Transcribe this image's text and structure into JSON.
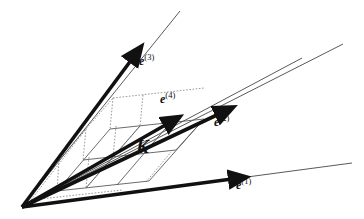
{
  "figure": {
    "background_color": "#ffffff",
    "stroke_color": "#111111",
    "thin_stroke_color": "#5a5a5a",
    "dotted_stroke_color": "#8d8d8d",
    "origin": {
      "x": 22,
      "y": 207
    }
  },
  "vectors": [
    {
      "name": "e1",
      "label_base": "e",
      "label_sup": "(1)",
      "label_text": "e(1)",
      "tip": {
        "x": 238,
        "y": 175
      },
      "ray_end": {
        "x": 352,
        "y": 163
      },
      "label_pos": {
        "x": 236,
        "y": 180
      }
    },
    {
      "name": "e2",
      "label_base": "e",
      "label_sup": "(2)",
      "label_text": "e(2)",
      "tip": {
        "x": 225,
        "y": 110
      },
      "ray_end": {
        "x": 313,
        "y": 57
      },
      "label_pos": {
        "x": 215,
        "y": 117
      }
    },
    {
      "name": "e3",
      "label_base": "e",
      "label_sup": "(3)",
      "label_text": "e(3)",
      "tip": {
        "x": 137,
        "y": 53
      },
      "ray_end": {
        "x": 180,
        "y": 11
      },
      "label_pos": {
        "x": 139,
        "y": 57
      }
    },
    {
      "name": "e4",
      "label_base": "e",
      "label_sup": "(4)",
      "label_text": "e(4)",
      "tip": {
        "x": 172,
        "y": 120
      },
      "ray_end": {
        "x": 261,
        "y": 83
      },
      "label_pos": {
        "x": 162,
        "y": 94
      }
    }
  ],
  "cell": {
    "name": "K",
    "label": "K",
    "label_pos": {
      "x": 139,
      "y": 146
    }
  },
  "lattice": {
    "solid_lines": [
      {
        "name": "grid-a1",
        "x1": 57,
        "y1": 191,
        "x2": 146,
        "y2": 182
      },
      {
        "name": "grid-a2",
        "x1": 83,
        "y1": 160,
        "x2": 174,
        "y2": 151
      },
      {
        "name": "grid-a3",
        "x1": 110,
        "y1": 129,
        "x2": 201,
        "y2": 119
      },
      {
        "name": "grid-b1",
        "x1": 57,
        "y1": 191,
        "x2": 110,
        "y2": 129
      },
      {
        "name": "grid-b2",
        "x1": 86,
        "y1": 188,
        "x2": 140,
        "y2": 125
      },
      {
        "name": "grid-b3",
        "x1": 116,
        "y1": 185,
        "x2": 170,
        "y2": 122
      },
      {
        "name": "grid-b4",
        "x1": 146,
        "y1": 182,
        "x2": 201,
        "y2": 119
      }
    ],
    "dotted_lines": [
      {
        "name": "dot-v1",
        "x1": 59,
        "y1": 160,
        "x2": 57,
        "y2": 191
      },
      {
        "name": "dot-v2",
        "x1": 86,
        "y1": 129,
        "x2": 83,
        "y2": 160
      },
      {
        "name": "dot-v3",
        "x1": 113,
        "y1": 98,
        "x2": 110,
        "y2": 129
      },
      {
        "name": "dot-v4",
        "x1": 89,
        "y1": 157,
        "x2": 86,
        "y2": 188
      },
      {
        "name": "dot-v5",
        "x1": 116,
        "y1": 126,
        "x2": 113,
        "y2": 157
      },
      {
        "name": "dot-v6",
        "x1": 143,
        "y1": 95,
        "x2": 140,
        "y2": 126
      },
      {
        "name": "dot-h1",
        "x1": 59,
        "y1": 160,
        "x2": 113,
        "y2": 98
      },
      {
        "name": "dot-h2",
        "x1": 113,
        "y1": 98,
        "x2": 201,
        "y2": 88
      },
      {
        "name": "dot-h3",
        "x1": 30,
        "y1": 200,
        "x2": 119,
        "y2": 190
      }
    ]
  }
}
